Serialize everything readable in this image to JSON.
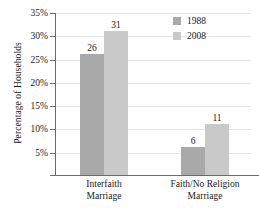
{
  "chart_data": {
    "type": "bar",
    "title": "",
    "xlabel": "",
    "ylabel": "Percentage of Households",
    "categories": [
      "Interfaith Marriage",
      "Faith/No Religion Marriage"
    ],
    "category_lines": [
      [
        "Interfaith",
        "Marriage"
      ],
      [
        "Faith/No Religion",
        "Marriage"
      ]
    ],
    "series": [
      {
        "name": "1988",
        "values": [
          26,
          6
        ],
        "color": "#a9a9a9"
      },
      {
        "name": "2008",
        "values": [
          31,
          11
        ],
        "color": "#c9c9c9"
      }
    ],
    "ylim": [
      0,
      35
    ],
    "ytick_values": [
      5,
      10,
      15,
      20,
      25,
      30,
      35
    ],
    "ytick_labels": [
      "5%",
      "10%",
      "15%",
      "20%",
      "25%",
      "30%",
      "35%"
    ],
    "grid": true,
    "legend_position": "top-right",
    "value_labels": [
      "26",
      "31",
      "6",
      "11"
    ]
  },
  "legend": {
    "items": [
      {
        "label": "1988",
        "color": "#a9a9a9",
        "swatch_name": "legend-swatch-1988"
      },
      {
        "label": "2008",
        "color": "#c9c9c9",
        "swatch_name": "legend-swatch-2008"
      }
    ]
  },
  "axis": {
    "y_title": "Percentage of Households",
    "y_ticks": [
      "35%",
      "30%",
      "25%",
      "20%",
      "15%",
      "10%",
      "5%"
    ]
  },
  "colors": {
    "series_1988": "#a9a9a9",
    "series_2008": "#c9c9c9",
    "axis": "#6b6b6b",
    "grid": "#e6e6e6",
    "text": "#1a1a1a",
    "background": "#ffffff"
  }
}
